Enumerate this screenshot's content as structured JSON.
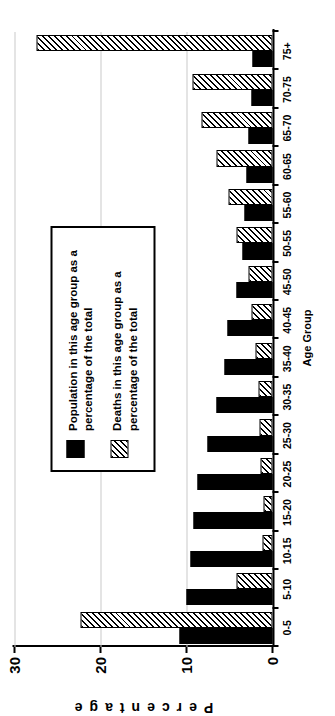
{
  "chart_data": {
    "type": "bar",
    "title": "",
    "xlabel": "Age Group",
    "ylabel": "Percentage",
    "ylim": [
      0,
      30
    ],
    "yticks": [
      0,
      10,
      20,
      30
    ],
    "grid": true,
    "legend_position": "inside-upper-left",
    "orientation": "image rotated 90 degrees counter-clockwise",
    "categories": [
      "0-5",
      "5-10",
      "10-15",
      "15-20",
      "20-25",
      "25-30",
      "30-35",
      "35-40",
      "40-45",
      "45-50",
      "50-55",
      "55-60",
      "60-65",
      "65-70",
      "70-75",
      "75+"
    ],
    "series": [
      {
        "name": "Population in this age group as a percentage of the total",
        "style": "solid-black",
        "values": [
          10.8,
          10.0,
          9.5,
          9.2,
          8.7,
          7.6,
          6.5,
          5.6,
          5.2,
          4.2,
          3.5,
          3.2,
          3.0,
          2.8,
          2.5,
          2.3
        ]
      },
      {
        "name": "Deaths in this age group as a percentage of the total",
        "style": "diagonal-hatch",
        "values": [
          22.3,
          4.2,
          1.2,
          1.0,
          1.4,
          1.5,
          1.6,
          2.0,
          2.4,
          2.8,
          4.2,
          5.1,
          6.5,
          8.2,
          9.3,
          27.5
        ]
      }
    ]
  },
  "axes": {
    "y_tick_labels": [
      "0",
      "10",
      "20",
      "30"
    ],
    "y_axis_title": "Percentage",
    "x_axis_title": "Age Group"
  },
  "legend": {
    "entries": [
      {
        "label": "Population in this age group as a percentage of the total",
        "swatch": "solid-black-swatch"
      },
      {
        "label": "Deaths in this age group as a percentage of the total",
        "swatch": "hatched-swatch"
      }
    ]
  },
  "colors": {
    "population": "#000000",
    "deaths_outline": "#000000",
    "grid": "#c9c9c9",
    "background": "#ffffff"
  }
}
